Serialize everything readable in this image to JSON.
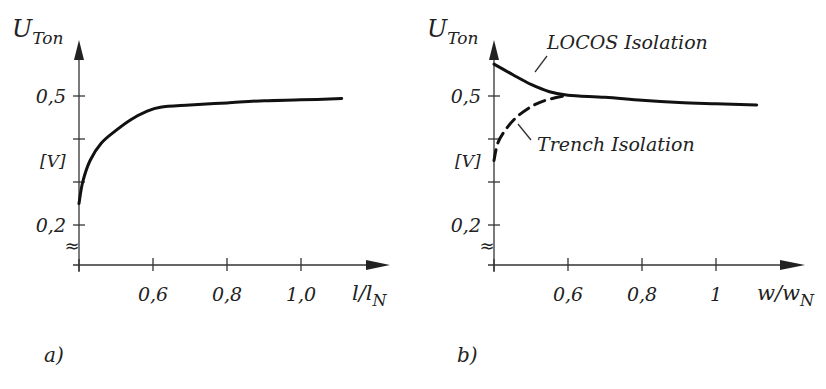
{
  "chart_data": [
    {
      "type": "line",
      "panel_label": "a)",
      "title": "",
      "ylabel": "U",
      "ylabel_sub": "Ton",
      "yunit": "[V]",
      "xlabel": "l/l",
      "xlabel_sub": "N",
      "xlim": [
        0.4,
        1.2
      ],
      "ylim": [
        0.1,
        0.6
      ],
      "axis_break": true,
      "grid": false,
      "x_ticks": [
        0.6,
        0.8,
        1.0
      ],
      "x_tick_labels": [
        "0,6",
        "0,8",
        "1,0"
      ],
      "y_ticks": [
        0.2,
        0.3,
        0.4,
        0.5
      ],
      "y_tick_labels": [
        "0,2",
        "",
        "",
        "0,5"
      ],
      "series": [
        {
          "name": "U_Ton",
          "style": "solid",
          "x": [
            0.4,
            0.41,
            0.43,
            0.46,
            0.5,
            0.54,
            0.58,
            0.62,
            0.7,
            0.8,
            0.9,
            1.0,
            1.11
          ],
          "y": [
            0.25,
            0.3,
            0.35,
            0.39,
            0.42,
            0.445,
            0.463,
            0.474,
            0.479,
            0.484,
            0.489,
            0.491,
            0.494
          ]
        }
      ]
    },
    {
      "type": "line",
      "panel_label": "b)",
      "title": "",
      "ylabel": "U",
      "ylabel_sub": "Ton",
      "yunit": "[V]",
      "xlabel": "w/w",
      "xlabel_sub": "N",
      "xlim": [
        0.4,
        1.2
      ],
      "ylim": [
        0.1,
        0.6
      ],
      "axis_break": true,
      "grid": false,
      "x_ticks": [
        0.6,
        0.8,
        1.0
      ],
      "x_tick_labels": [
        "0,6",
        "0,8",
        "1"
      ],
      "y_ticks": [
        0.2,
        0.3,
        0.4,
        0.5
      ],
      "y_tick_labels": [
        "0,2",
        "",
        "",
        "0,5"
      ],
      "series": [
        {
          "name": "LOCOS Isolation",
          "style": "solid",
          "x": [
            0.4,
            0.45,
            0.5,
            0.55,
            0.6,
            0.7,
            0.8,
            0.9,
            1.0,
            1.11
          ],
          "y": [
            0.574,
            0.55,
            0.527,
            0.51,
            0.502,
            0.497,
            0.49,
            0.485,
            0.482,
            0.479
          ]
        },
        {
          "name": "Trench Isolation",
          "style": "dashed",
          "x": [
            0.4,
            0.41,
            0.43,
            0.46,
            0.5,
            0.54,
            0.6
          ],
          "y": [
            0.35,
            0.39,
            0.42,
            0.45,
            0.475,
            0.49,
            0.502
          ]
        }
      ],
      "annotations": [
        "LOCOS Isolation",
        "Trench Isolation"
      ]
    }
  ]
}
